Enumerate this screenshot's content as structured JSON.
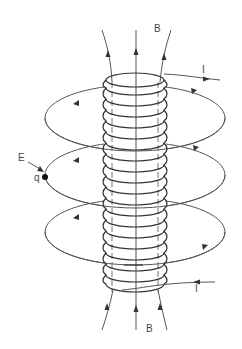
{
  "diagram": {
    "labels": {
      "b_top": "B",
      "b_bottom": "B",
      "i_top": "I",
      "i_bottom": "I",
      "e_field": "E",
      "charge": "q"
    },
    "colors": {
      "line": "#555555",
      "coil": "#333333",
      "background": "#ffffff"
    },
    "components": [
      "solenoid-coil",
      "magnetic-field-lines-B",
      "current-leads-I",
      "induced-electric-field-loops-E",
      "test-charge-q"
    ]
  }
}
